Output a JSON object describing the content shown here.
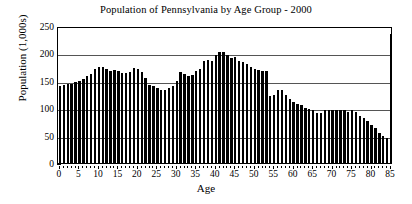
{
  "chart_data": {
    "type": "bar",
    "title": "Population of Pennsylvania by Age Group - 2000",
    "xlabel": "Age",
    "ylabel": "Population (1,000s)",
    "ylim": [
      0,
      250
    ],
    "xlim": [
      -1,
      86
    ],
    "ytick_labels": [
      "0",
      "50",
      "100",
      "150",
      "200",
      "250"
    ],
    "ytick_values": [
      0,
      50,
      100,
      150,
      200,
      250
    ],
    "xtick_labels": [
      "0",
      "5",
      "10",
      "15",
      "20",
      "25",
      "30",
      "35",
      "40",
      "45",
      "50",
      "55",
      "60",
      "65",
      "70",
      "75",
      "80",
      "85"
    ],
    "xtick_values": [
      0,
      5,
      10,
      15,
      20,
      25,
      30,
      35,
      40,
      45,
      50,
      55,
      60,
      65,
      70,
      75,
      80,
      85
    ],
    "grid": "horizontal",
    "legend": "none",
    "bar_color": "#000000",
    "categories": [
      0,
      1,
      2,
      3,
      4,
      5,
      6,
      7,
      8,
      9,
      10,
      11,
      12,
      13,
      14,
      15,
      16,
      17,
      18,
      19,
      20,
      21,
      22,
      23,
      24,
      25,
      26,
      27,
      28,
      29,
      30,
      31,
      32,
      33,
      34,
      35,
      36,
      37,
      38,
      39,
      40,
      41,
      42,
      43,
      44,
      45,
      46,
      47,
      48,
      49,
      50,
      51,
      52,
      53,
      54,
      55,
      56,
      57,
      58,
      59,
      60,
      61,
      62,
      63,
      64,
      65,
      66,
      67,
      68,
      69,
      70,
      71,
      72,
      73,
      74,
      75,
      76,
      77,
      78,
      79,
      80,
      81,
      82,
      83,
      84,
      85
    ],
    "values": [
      141,
      142,
      144,
      144,
      147,
      150,
      154,
      159,
      163,
      172,
      176,
      175,
      171,
      168,
      170,
      168,
      164,
      164,
      166,
      173,
      172,
      166,
      155,
      143,
      140,
      136,
      134,
      134,
      136,
      141,
      150,
      166,
      163,
      159,
      161,
      167,
      172,
      186,
      188,
      186,
      198,
      202,
      202,
      197,
      192,
      193,
      187,
      184,
      180,
      175,
      171,
      170,
      168,
      168,
      122,
      124,
      133,
      134,
      124,
      116,
      112,
      108,
      105,
      101,
      99,
      96,
      91,
      91,
      96,
      97,
      97,
      97,
      97,
      97,
      94,
      97,
      93,
      85,
      83,
      76,
      70,
      63,
      54,
      50,
      45,
      235
    ],
    "annotations": {
      "peak_age": 42,
      "peak_value": 202,
      "final_bar_label": "85+",
      "final_bar_value": 235
    }
  },
  "figure": {
    "background": "#ffffff",
    "axis_color": "#000000",
    "grid_color": "#555555"
  }
}
